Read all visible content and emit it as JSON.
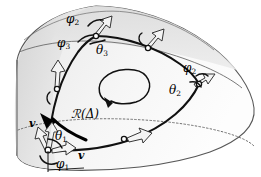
{
  "figure": {
    "width": 261,
    "height": 177,
    "background": "#ffffff"
  },
  "colors": {
    "surface_outer": "#e3e3e3",
    "surface_band": "#d8d8d8",
    "surface_inner": "#fbfbfb",
    "outline": "#4a4a4a",
    "curve": "#111111",
    "dotted_rim": "#6e6e6e",
    "arrow_fill": "#f2f2f2",
    "arrow_stroke": "#2a2a2a",
    "text": "#000000"
  },
  "labels": {
    "phi2_top": {
      "base": "φ",
      "sub": "2"
    },
    "phi3": {
      "base": "φ",
      "sub": "3"
    },
    "theta3": {
      "base": "θ",
      "sub": "3"
    },
    "phi2_right": {
      "base": "φ",
      "sub": "2"
    },
    "theta2": {
      "base": "θ",
      "sub": "2"
    },
    "theta1": {
      "base": "θ",
      "sub": "1"
    },
    "phi1": {
      "base": "φ",
      "sub": "1"
    },
    "holonomy": {
      "text": "ℛ(Δ)"
    },
    "vector_v": {
      "base": "v",
      "sub": ""
    },
    "vector_v_transported": {
      "base": "v",
      "sub": "′"
    }
  },
  "elements": {
    "rotation_arrow": "counterclockwise-loop-arrow",
    "vertices": [
      "bottom-left-vertex",
      "top-vertex",
      "right-vertex"
    ],
    "transport_frames": [
      "frame-arrow-bottom-left",
      "frame-arrow-left-mid",
      "frame-arrow-top-vertex",
      "frame-arrow-top-right",
      "frame-arrow-right-vertex",
      "frame-arrow-bottom-mid"
    ],
    "nodes": [
      "node-left-mid",
      "node-top-right",
      "node-bottom-mid"
    ],
    "back_rim": "dotted-ellipse-rim"
  }
}
